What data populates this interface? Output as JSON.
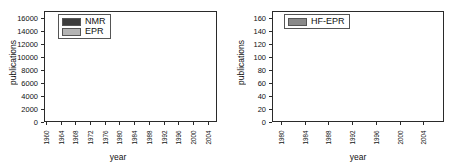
{
  "figure": {
    "panels": [
      {
        "id": "left",
        "axis": {
          "xlabel": "year",
          "ylabel": "publications"
        },
        "legend": [
          {
            "label": "NMR",
            "color": "#3d3d3d",
            "swatch": "legend-swatch-nmr"
          },
          {
            "label": "EPR",
            "color": "#b4b4b4",
            "swatch": "legend-swatch-epr"
          }
        ],
        "yticks": [
          "0",
          "2000",
          "4000",
          "6000",
          "8000",
          "10000",
          "12000",
          "14000",
          "16000"
        ],
        "xticks": [
          "1960",
          "1964",
          "1968",
          "1972",
          "1976",
          "1980",
          "1984",
          "1988",
          "1992",
          "1996",
          "2000",
          "2004"
        ]
      },
      {
        "id": "right",
        "axis": {
          "xlabel": "year",
          "ylabel": "publications"
        },
        "legend": [
          {
            "label": "HF-EPR",
            "color": "#8a8a8a",
            "swatch": "legend-swatch-hfepr"
          }
        ],
        "yticks": [
          "0",
          "20",
          "40",
          "60",
          "80",
          "100",
          "120",
          "140",
          "160"
        ],
        "xticks": [
          "1980",
          "1984",
          "1988",
          "1992",
          "1996",
          "2000",
          "2004"
        ]
      }
    ]
  },
  "chart_data": [
    {
      "type": "bar",
      "id": "nmr-epr-publications",
      "title": "",
      "xlabel": "year",
      "ylabel": "publications",
      "ylim": [
        0,
        17000
      ],
      "ytick_step": 2000,
      "grid": false,
      "legend_position": "top-left",
      "stacked": true,
      "categories": [
        1960,
        1961,
        1962,
        1963,
        1964,
        1965,
        1966,
        1967,
        1968,
        1969,
        1970,
        1971,
        1972,
        1973,
        1974,
        1975,
        1976,
        1977,
        1978,
        1979,
        1980,
        1981,
        1982,
        1983,
        1984,
        1985,
        1986,
        1987,
        1988,
        1989,
        1990,
        1991,
        1992,
        1993,
        1994,
        1995,
        1996,
        1997,
        1998,
        1999,
        2000,
        2001,
        2002,
        2003,
        2004,
        2005,
        2006
      ],
      "series": [
        {
          "name": "EPR",
          "color": "#b4b4b4",
          "values": [
            40,
            70,
            110,
            170,
            240,
            330,
            430,
            560,
            660,
            700,
            740,
            780,
            800,
            790,
            780,
            800,
            820,
            840,
            870,
            900,
            960,
            1020,
            1080,
            1140,
            1180,
            1200,
            1180,
            1160,
            1200,
            1400,
            2000,
            2400,
            2900,
            3150,
            3300,
            3400,
            3500,
            3600,
            3700,
            3800,
            3850,
            3900,
            3950,
            4000,
            4050,
            4100,
            4150
          ]
        },
        {
          "name": "NMR",
          "color": "#3d3d3d",
          "values": [
            60,
            110,
            180,
            260,
            380,
            520,
            640,
            700,
            760,
            800,
            840,
            880,
            900,
            920,
            940,
            960,
            1000,
            1060,
            1150,
            1300,
            1500,
            1700,
            1900,
            2150,
            2350,
            2350,
            2300,
            2350,
            2400,
            2850,
            8600,
            7900,
            8400,
            8950,
            9000,
            9100,
            9400,
            9300,
            9550,
            9800,
            10150,
            10300,
            10600,
            11150,
            11700,
            12100,
            12200
          ]
        }
      ],
      "totals": [
        100,
        180,
        290,
        430,
        620,
        850,
        1070,
        1260,
        1420,
        1500,
        1580,
        1660,
        1700,
        1710,
        1720,
        1760,
        1820,
        1900,
        2020,
        2200,
        2460,
        2720,
        2980,
        3290,
        3530,
        3550,
        3480,
        3510,
        3600,
        4250,
        10600,
        10300,
        11300,
        12100,
        12300,
        12500,
        12900,
        12900,
        13250,
        13600,
        14000,
        14200,
        14550,
        15150,
        15750,
        16200,
        16350
      ]
    },
    {
      "type": "bar",
      "id": "hf-epr-publications",
      "title": "",
      "xlabel": "year",
      "ylabel": "publications",
      "ylim": [
        0,
        170
      ],
      "ytick_step": 20,
      "grid": false,
      "legend_position": "top-left",
      "stacked": false,
      "categories": [
        1979,
        1980,
        1981,
        1982,
        1983,
        1984,
        1985,
        1986,
        1987,
        1988,
        1989,
        1990,
        1991,
        1992,
        1993,
        1994,
        1995,
        1996,
        1997,
        1998,
        1999,
        2000,
        2001,
        2002,
        2003,
        2004,
        2005,
        2006,
        2007
      ],
      "series": [
        {
          "name": "HF-EPR",
          "color": "#8a8a8a",
          "values": [
            1,
            1,
            1,
            1,
            1,
            1,
            2,
            1,
            2,
            5,
            8,
            12,
            30,
            42,
            56,
            62,
            61,
            58,
            56,
            94,
            100,
            109,
            137,
            114,
            159,
            152,
            155,
            155,
            158
          ]
        }
      ]
    }
  ]
}
